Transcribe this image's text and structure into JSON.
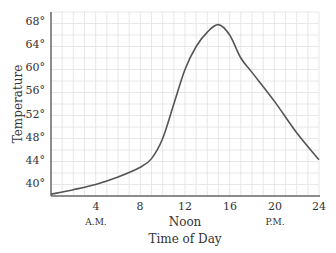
{
  "chart_data": {
    "type": "line",
    "title": "",
    "xlabel": "Time of Day",
    "ylabel": "Temperature",
    "xlim": [
      0,
      24
    ],
    "ylim": [
      38,
      70
    ],
    "grid": true,
    "x_ticks": [
      "4",
      "8",
      "12",
      "16",
      "20",
      "24"
    ],
    "x_tick_values": [
      4,
      8,
      12,
      16,
      20,
      24
    ],
    "x_sublabels": [
      {
        "x": 4,
        "label": "A.M."
      },
      {
        "x": 12,
        "label": "Noon"
      },
      {
        "x": 20,
        "label": "P.M."
      }
    ],
    "y_ticks": [
      "40°",
      "44°",
      "48°",
      "52°",
      "56°",
      "60°",
      "64°",
      "68°"
    ],
    "y_tick_values": [
      40,
      44,
      48,
      52,
      56,
      60,
      64,
      68
    ],
    "series": [
      {
        "name": "Temperature",
        "x": [
          0,
          2,
          4,
          6,
          8,
          9,
          10,
          11,
          12,
          13,
          14,
          15,
          16,
          17,
          18,
          20,
          22,
          24
        ],
        "values": [
          38.3,
          39.1,
          40.0,
          41.3,
          43.0,
          44.5,
          48.0,
          54.0,
          60.0,
          64.0,
          66.5,
          67.8,
          66.0,
          62.0,
          59.5,
          54.5,
          49.0,
          44.3
        ]
      }
    ]
  },
  "labels": {
    "ylabel": "Temperature",
    "xlabel": "Time of Day",
    "yticks": [
      "68°",
      "64°",
      "60°",
      "56°",
      "52°",
      "48°",
      "44°",
      "40°"
    ],
    "xticks": [
      "4",
      "8",
      "12",
      "16",
      "20",
      "24"
    ],
    "sub": {
      "am": "A.M.",
      "noon": "Noon",
      "pm": "P.M."
    }
  },
  "colors": {
    "line": "#555555",
    "grid": "#e2e2e2",
    "axis": "#666666"
  }
}
